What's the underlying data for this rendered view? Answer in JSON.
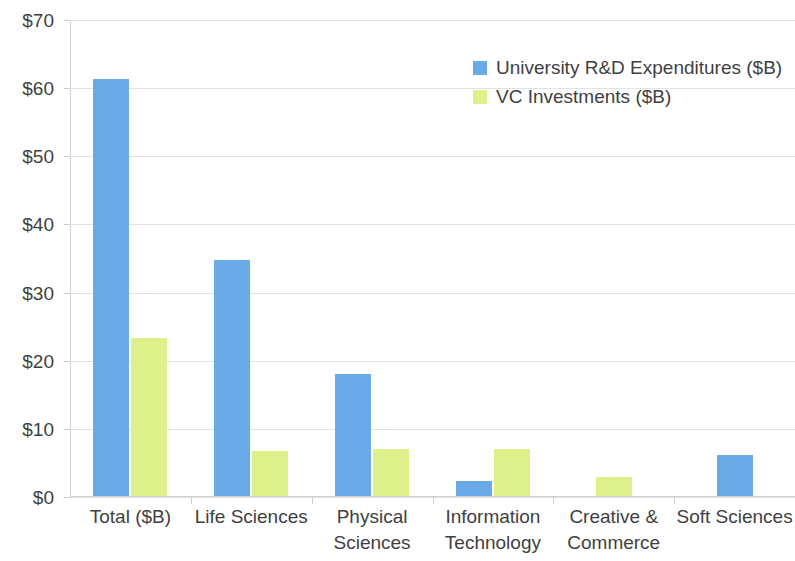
{
  "chart_data": {
    "type": "bar",
    "title": "",
    "subtitle": "",
    "xlabel": "",
    "ylabel": "",
    "grid": true,
    "legend_position": "top-right-inside",
    "ylim": [
      0,
      70
    ],
    "ytick_step": 10,
    "ytick_labels": [
      "$70",
      "$60",
      "$50",
      "$40",
      "$30",
      "$20",
      "$10",
      "$0"
    ],
    "ytick_values": [
      70,
      60,
      50,
      40,
      30,
      20,
      10,
      0
    ],
    "categories": [
      "Total ($B)",
      "Life Sciences",
      "Physical Sciences",
      "Information Technology",
      "Creative & Commerce",
      "Soft Sciences"
    ],
    "category_lines": [
      [
        "Total ($B)"
      ],
      [
        "Life Sciences"
      ],
      [
        "Physical",
        "Sciences"
      ],
      [
        "Information",
        "Technology"
      ],
      [
        "Creative &",
        "Commerce"
      ],
      [
        "Soft Sciences"
      ]
    ],
    "series": [
      {
        "name": "University R&D Expenditures ($B)",
        "color": "#6baae8",
        "values": [
          61.3,
          34.8,
          18.1,
          2.4,
          null,
          6.2
        ]
      },
      {
        "name": "VC Investments ($B)",
        "color": "#ddf08c",
        "values": [
          23.3,
          6.7,
          7.0,
          7.0,
          3.0,
          null
        ]
      }
    ]
  },
  "legend": {
    "entries": [
      {
        "label": "University R&D Expenditures ($B)",
        "color": "#6baae8"
      },
      {
        "label": "VC Investments ($B)",
        "color": "#ddf08c"
      }
    ]
  }
}
